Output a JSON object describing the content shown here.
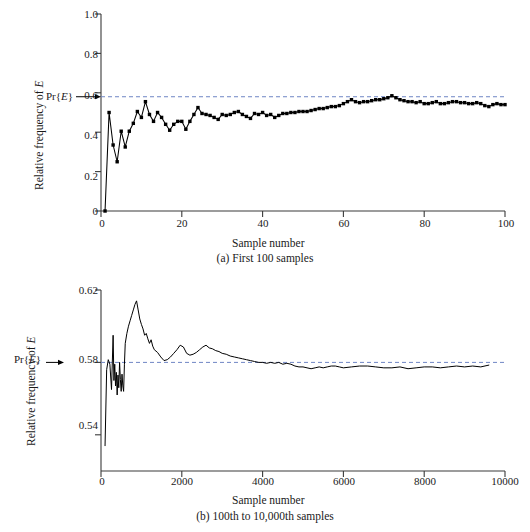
{
  "figure": {
    "title": "",
    "panels": [
      {
        "id": "a",
        "caption": "(a) First 100 samples",
        "xlabel": "Sample number",
        "ylabel_prefix": "Relative frequency of ",
        "ylabel_italic": "E",
        "pr_label_pre": "Pr{",
        "pr_label_italic": "E",
        "pr_label_post": "}",
        "xticks": [
          "0",
          "20",
          "40",
          "60",
          "80",
          "100"
        ],
        "yticks": [
          "0",
          "0.2",
          "0.4",
          "0.6",
          "0.8",
          "1.0"
        ]
      },
      {
        "id": "b",
        "caption": "(b) 100th to 10,000th samples",
        "xlabel": "Sample number",
        "ylabel_prefix": "Relative frequency of ",
        "ylabel_italic": "E",
        "pr_label_pre": "Pr{",
        "pr_label_italic": "E",
        "pr_label_post": "}",
        "xticks": [
          "0",
          "2000",
          "4000",
          "6000",
          "8000",
          "10000"
        ],
        "yticks": [
          "0.54",
          "0.58",
          "0.62"
        ]
      }
    ],
    "colors": {
      "reference_line": "#6f86c4",
      "data_line": "#000000",
      "axis": "#3a3a3a"
    }
  },
  "chart_data": [
    {
      "type": "line",
      "panel": "a",
      "title": "(a) First 100 samples",
      "xlabel": "Sample number",
      "ylabel": "Relative frequency of E",
      "xlim": [
        0,
        100
      ],
      "ylim": [
        0,
        1.0
      ],
      "xticks": [
        0,
        20,
        40,
        60,
        80,
        100
      ],
      "yticks": [
        0,
        0.2,
        0.4,
        0.6,
        0.8,
        1.0
      ],
      "grid": false,
      "legend": "none",
      "markers": "filled-square",
      "annotations": [
        {
          "text": "Pr{E}",
          "value": 0.58,
          "type": "horizontal-reference-line",
          "style": "dashed",
          "color": "#6f86c4"
        }
      ],
      "x": [
        1,
        2,
        3,
        4,
        5,
        6,
        7,
        8,
        9,
        10,
        11,
        12,
        13,
        14,
        15,
        16,
        17,
        18,
        19,
        20,
        21,
        22,
        23,
        24,
        25,
        26,
        27,
        28,
        29,
        30,
        31,
        32,
        33,
        34,
        35,
        36,
        37,
        38,
        39,
        40,
        41,
        42,
        43,
        44,
        45,
        46,
        47,
        48,
        49,
        50,
        51,
        52,
        53,
        54,
        55,
        56,
        57,
        58,
        59,
        60,
        61,
        62,
        63,
        64,
        65,
        66,
        67,
        68,
        69,
        70,
        71,
        72,
        73,
        74,
        75,
        76,
        77,
        78,
        79,
        80,
        81,
        82,
        83,
        84,
        85,
        86,
        87,
        88,
        89,
        90,
        91,
        92,
        93,
        94,
        95,
        96,
        97,
        98,
        99,
        100
      ],
      "y": [
        0.0,
        0.5,
        0.335,
        0.25,
        0.405,
        0.325,
        0.405,
        0.445,
        0.505,
        0.475,
        0.555,
        0.49,
        0.455,
        0.5,
        0.475,
        0.44,
        0.41,
        0.44,
        0.455,
        0.455,
        0.415,
        0.455,
        0.49,
        0.525,
        0.495,
        0.49,
        0.485,
        0.475,
        0.465,
        0.49,
        0.485,
        0.49,
        0.5,
        0.505,
        0.49,
        0.48,
        0.47,
        0.495,
        0.49,
        0.5,
        0.485,
        0.49,
        0.475,
        0.485,
        0.495,
        0.495,
        0.5,
        0.5,
        0.505,
        0.505,
        0.505,
        0.51,
        0.515,
        0.52,
        0.52,
        0.525,
        0.53,
        0.53,
        0.535,
        0.545,
        0.555,
        0.565,
        0.555,
        0.55,
        0.555,
        0.555,
        0.56,
        0.565,
        0.565,
        0.57,
        0.575,
        0.585,
        0.575,
        0.565,
        0.56,
        0.555,
        0.555,
        0.55,
        0.555,
        0.545,
        0.545,
        0.55,
        0.555,
        0.545,
        0.545,
        0.55,
        0.555,
        0.555,
        0.55,
        0.55,
        0.545,
        0.545,
        0.55,
        0.545,
        0.535,
        0.53,
        0.54,
        0.545,
        0.54,
        0.54
      ]
    },
    {
      "type": "line",
      "panel": "b",
      "title": "(b) 100th to 10,000th samples",
      "xlabel": "Sample number",
      "ylabel": "Relative frequency of E",
      "xlim": [
        0,
        10000
      ],
      "ylim": [
        0.52,
        0.62
      ],
      "xticks": [
        0,
        2000,
        4000,
        6000,
        8000,
        10000
      ],
      "yticks": [
        0.54,
        0.58,
        0.62
      ],
      "grid": false,
      "legend": "none",
      "markers": "none",
      "annotations": [
        {
          "text": "Pr{E}",
          "value": 0.58,
          "type": "horizontal-reference-line",
          "style": "dashed",
          "color": "#6f86c4"
        }
      ],
      "x": [
        100,
        140,
        180,
        220,
        260,
        300,
        320,
        340,
        360,
        380,
        400,
        420,
        440,
        460,
        480,
        500,
        520,
        540,
        560,
        580,
        600,
        640,
        680,
        720,
        760,
        800,
        840,
        880,
        920,
        960,
        1000,
        1040,
        1080,
        1120,
        1160,
        1200,
        1240,
        1280,
        1320,
        1400,
        1480,
        1560,
        1640,
        1720,
        1800,
        1880,
        1960,
        2040,
        2120,
        2200,
        2280,
        2360,
        2440,
        2520,
        2600,
        2680,
        2760,
        2840,
        2920,
        3000,
        3100,
        3200,
        3300,
        3400,
        3500,
        3600,
        3700,
        3800,
        3900,
        4000,
        4100,
        4200,
        4300,
        4400,
        4500,
        4600,
        4700,
        4800,
        4900,
        5000,
        5100,
        5200,
        5300,
        5400,
        5500,
        5600,
        5700,
        5800,
        5900,
        6000,
        6200,
        6400,
        6600,
        6800,
        7000,
        7200,
        7400,
        7600,
        7800,
        8000,
        8200,
        8400,
        8600,
        8800,
        9000,
        9200,
        9400,
        9600
      ],
      "y": [
        0.534,
        0.576,
        0.5815,
        0.579,
        0.565,
        0.595,
        0.57,
        0.579,
        0.567,
        0.5745,
        0.562,
        0.573,
        0.566,
        0.58,
        0.5705,
        0.564,
        0.5735,
        0.567,
        0.564,
        0.579,
        0.5905,
        0.596,
        0.6,
        0.603,
        0.606,
        0.609,
        0.612,
        0.614,
        0.609,
        0.604,
        0.601,
        0.5985,
        0.595,
        0.596,
        0.593,
        0.5905,
        0.5925,
        0.589,
        0.587,
        0.5855,
        0.583,
        0.581,
        0.5815,
        0.583,
        0.585,
        0.587,
        0.5895,
        0.5885,
        0.585,
        0.584,
        0.5845,
        0.5855,
        0.587,
        0.5885,
        0.5895,
        0.588,
        0.5875,
        0.5865,
        0.586,
        0.585,
        0.5845,
        0.5835,
        0.583,
        0.5825,
        0.582,
        0.5815,
        0.581,
        0.5805,
        0.58,
        0.58,
        0.5795,
        0.58,
        0.5795,
        0.58,
        0.579,
        0.5795,
        0.579,
        0.578,
        0.5775,
        0.5775,
        0.577,
        0.5765,
        0.577,
        0.5775,
        0.577,
        0.5775,
        0.578,
        0.578,
        0.5775,
        0.577,
        0.5775,
        0.578,
        0.578,
        0.5775,
        0.577,
        0.577,
        0.5775,
        0.5765,
        0.577,
        0.5775,
        0.5775,
        0.577,
        0.5775,
        0.578,
        0.5775,
        0.578,
        0.5775,
        0.5785
      ]
    }
  ]
}
